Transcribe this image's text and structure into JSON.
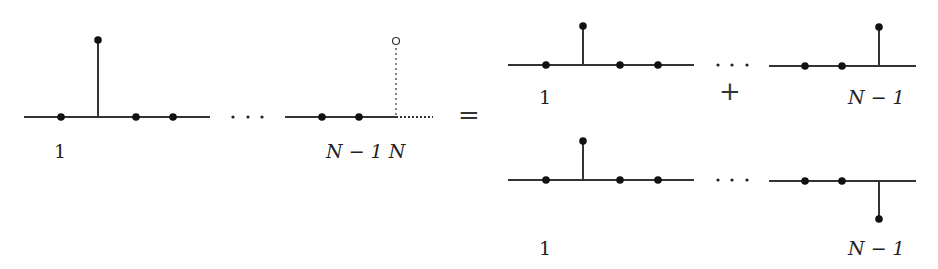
{
  "diagram": {
    "lhs": {
      "first_segment_label": "1",
      "last_segment_label": "N − 1 N",
      "ellipsis": "· · ·",
      "dotted_leg_endpoint": "open-circle"
    },
    "equals": "=",
    "plus": "+",
    "rhs": {
      "top": {
        "first_label": "1",
        "last_label": "N − 1",
        "ellipsis": "· · ·",
        "last_leg_direction": "up"
      },
      "bottom": {
        "first_label": "1",
        "last_label": "N − 1",
        "ellipsis": "· · ·",
        "last_leg_direction": "down"
      }
    },
    "colors": {
      "line": "#333333",
      "dot": "#111111"
    }
  }
}
